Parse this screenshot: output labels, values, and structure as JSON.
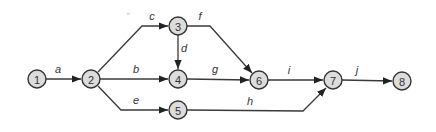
{
  "diagram": {
    "type": "activity-on-arrow network",
    "nodes": [
      {
        "id": "1",
        "label": "1",
        "x": 37,
        "y": 79
      },
      {
        "id": "2",
        "label": "2",
        "x": 91,
        "y": 79
      },
      {
        "id": "3",
        "label": "3",
        "x": 178,
        "y": 26
      },
      {
        "id": "4",
        "label": "4",
        "x": 178,
        "y": 79
      },
      {
        "id": "5",
        "label": "5",
        "x": 178,
        "y": 110
      },
      {
        "id": "6",
        "label": "6",
        "x": 259,
        "y": 80
      },
      {
        "id": "7",
        "label": "7",
        "x": 333,
        "y": 80
      },
      {
        "id": "8",
        "label": "8",
        "x": 402,
        "y": 81
      }
    ],
    "edges": [
      {
        "label": "a",
        "from": "1",
        "to": "2"
      },
      {
        "label": "b",
        "from": "2",
        "to": "4"
      },
      {
        "label": "c",
        "from": "2",
        "to": "3"
      },
      {
        "label": "d",
        "from": "3",
        "to": "4"
      },
      {
        "label": "e",
        "from": "2",
        "to": "5"
      },
      {
        "label": "f",
        "from": "3",
        "to": "6"
      },
      {
        "label": "g",
        "from": "4",
        "to": "6"
      },
      {
        "label": "h",
        "from": "5",
        "to": "7"
      },
      {
        "label": "i",
        "from": "6",
        "to": "7"
      },
      {
        "label": "j",
        "from": "7",
        "to": "8"
      }
    ],
    "mark": "\""
  }
}
